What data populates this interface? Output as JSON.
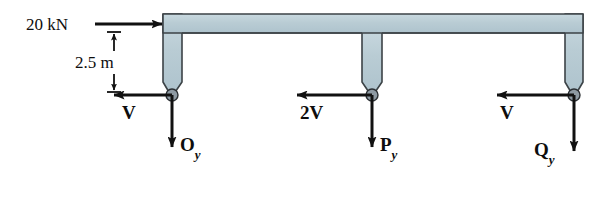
{
  "figure": {
    "kind": "free-body-diagram",
    "background_color": "#ffffff",
    "member_fill": "#b9ccd4",
    "member_stroke": "#3c4347",
    "pin_fill": "#8e9aa3",
    "pin_stroke": "#2b2f33",
    "force_color": "#111111"
  },
  "labels": {
    "applied_load": "20 kN",
    "dimension": "2.5 m",
    "shear_left": "V",
    "shear_middle": "2V",
    "shear_right": "V",
    "reaction_left": {
      "base": "O",
      "sub": "y"
    },
    "reaction_middle": {
      "base": "P",
      "sub": "y"
    },
    "reaction_right": {
      "base": "Q",
      "sub": "y"
    }
  },
  "geometry": {
    "top_beam": {
      "x1": 163,
      "x2": 583,
      "y_top": 14,
      "y_bottom": 33
    },
    "legs": [
      {
        "name": "left-leg",
        "cx": 172,
        "y_top": 14,
        "y_pin": 95
      },
      {
        "name": "middle-leg",
        "cx": 372,
        "y_top": 14,
        "y_pin": 95
      },
      {
        "name": "right-leg",
        "cx": 574,
        "y_top": 14,
        "y_pin": 95
      }
    ],
    "pins": [
      {
        "name": "pin-O",
        "cx": 172,
        "cy": 95,
        "r": 6
      },
      {
        "name": "pin-P",
        "cx": 372,
        "cy": 95,
        "r": 6
      },
      {
        "name": "pin-Q",
        "cx": 574,
        "cy": 95,
        "r": 6
      }
    ],
    "forces": [
      {
        "name": "applied-load-20kn",
        "from_x": 95,
        "to_x": 163,
        "y": 24,
        "direction": "right"
      },
      {
        "name": "shear-left-V",
        "from_x": 172,
        "to_x": 113,
        "y": 95,
        "direction": "left"
      },
      {
        "name": "shear-middle-2V",
        "from_x": 372,
        "to_x": 296,
        "y": 95,
        "direction": "left"
      },
      {
        "name": "shear-right-V",
        "from_x": 574,
        "to_x": 496,
        "y": 95,
        "direction": "left"
      },
      {
        "name": "reaction-O-y",
        "x": 172,
        "from_y": 95,
        "to_y": 148,
        "direction": "down"
      },
      {
        "name": "reaction-P-y",
        "x": 372,
        "from_y": 95,
        "to_y": 148,
        "direction": "down"
      },
      {
        "name": "reaction-Q-y",
        "x": 574,
        "from_y": 95,
        "to_y": 152,
        "direction": "down"
      }
    ],
    "dimension_line": {
      "x": 114,
      "y_top": 32,
      "y_bottom": 92,
      "tick_half_width": 7
    }
  }
}
